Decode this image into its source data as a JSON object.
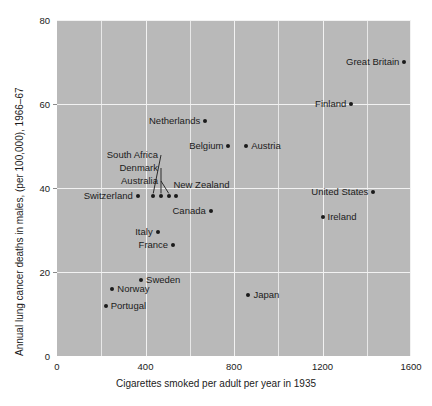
{
  "chart_data": {
    "type": "scatter",
    "title": "",
    "xlabel": "Cigarettes smoked per adult per year in 1935",
    "ylabel": "Annual lung cancer deaths in males, (per 100,000), 1966–67",
    "xlim": [
      0,
      1600
    ],
    "ylim": [
      0,
      80
    ],
    "xticks": [
      "0",
      "400",
      "800",
      "1200",
      "1600"
    ],
    "xtick_values": [
      0,
      400,
      800,
      1200,
      1600
    ],
    "yticks": [
      "0",
      "20",
      "40",
      "60",
      "80"
    ],
    "ytick_values": [
      0,
      20,
      40,
      60,
      80
    ],
    "grid": true,
    "grid_minor_x": [
      200,
      600,
      1000,
      1400
    ],
    "legend": "none",
    "background_color": "#b9b9b9",
    "gridline_color": "#f2f2f2",
    "point_color": "#1b1b1b",
    "points": [
      {
        "name": "Great Britain",
        "x": 1570,
        "y": 70,
        "label_side": "left"
      },
      {
        "name": "Finland",
        "x": 1330,
        "y": 60,
        "label_side": "left"
      },
      {
        "name": "Netherlands",
        "x": 670,
        "y": 56,
        "label_side": "left"
      },
      {
        "name": "Belgium",
        "x": 775,
        "y": 50,
        "label_side": "left"
      },
      {
        "name": "Austria",
        "x": 855,
        "y": 50,
        "label_side": "right"
      },
      {
        "name": "United States",
        "x": 1430,
        "y": 39,
        "label_side": "left"
      },
      {
        "name": "Switzerland",
        "x": 365,
        "y": 38,
        "label_side": "left"
      },
      {
        "name": "South Africa",
        "x": 435,
        "y": 38,
        "label_side": "leader"
      },
      {
        "name": "Denmark",
        "x": 470,
        "y": 38,
        "label_side": "leader"
      },
      {
        "name": "Australia",
        "x": 505,
        "y": 38,
        "label_side": "leader"
      },
      {
        "name": "New Zealand",
        "x": 540,
        "y": 38,
        "label_side": "above"
      },
      {
        "name": "Canada",
        "x": 695,
        "y": 34.5,
        "label_side": "left"
      },
      {
        "name": "Ireland",
        "x": 1200,
        "y": 33,
        "label_side": "right"
      },
      {
        "name": "Italy",
        "x": 455,
        "y": 29.5,
        "label_side": "left"
      },
      {
        "name": "France",
        "x": 525,
        "y": 26.5,
        "label_side": "left"
      },
      {
        "name": "Sweden",
        "x": 380,
        "y": 18,
        "label_side": "right"
      },
      {
        "name": "Norway",
        "x": 250,
        "y": 16,
        "label_side": "right"
      },
      {
        "name": "Japan",
        "x": 865,
        "y": 14.5,
        "label_side": "right"
      },
      {
        "name": "Portugal",
        "x": 220,
        "y": 12,
        "label_side": "right"
      }
    ],
    "leader_labels": [
      {
        "name": "South Africa",
        "target": "South Africa"
      },
      {
        "name": "Denmark",
        "target": "Denmark"
      },
      {
        "name": "Australia",
        "target": "Australia"
      }
    ]
  }
}
